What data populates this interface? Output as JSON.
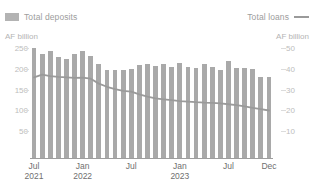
{
  "title": "",
  "legend": {
    "deposits": {
      "label": "Total deposits",
      "marker": "bar-swatch-icon",
      "color": "#b3b3b3"
    },
    "loans": {
      "label": "Total loans",
      "marker": "line-swatch-icon",
      "color": "#9a9a9a"
    }
  },
  "axes": {
    "left_unit": "AF billion",
    "right_unit": "AF billion",
    "left_ticks": [
      "250",
      "200",
      "150",
      "100",
      "50"
    ],
    "right_ticks": [
      "50",
      "40",
      "30",
      "20",
      "10"
    ],
    "x_ticks": [
      {
        "month": "Jul",
        "year": "2021"
      },
      {
        "month": "Jan",
        "year": "2022"
      },
      {
        "month": "Jul",
        "year": ""
      },
      {
        "month": "Jan",
        "year": "2023"
      },
      {
        "month": "Jul",
        "year": ""
      },
      {
        "month": "Dec",
        "year": ""
      }
    ]
  },
  "colors": {
    "bar": "#a9a9a9",
    "line": "#9a9a9a",
    "axis_text": "#bdbdbd",
    "x_text": "#6f6f6f",
    "baseline": "#9e9e9e"
  },
  "chart_data": {
    "type": "bar",
    "title": "",
    "xlabel": "",
    "ylabel": "AF billion",
    "y2label": "AF billion",
    "ylim": [
      0,
      250
    ],
    "y2lim": [
      0,
      50
    ],
    "grid": false,
    "legend_position": "top",
    "categories": [
      "Jul 2021",
      "Aug 2021",
      "Sep 2021",
      "Oct 2021",
      "Nov 2021",
      "Dec 2021",
      "Jan 2022",
      "Feb 2022",
      "Mar 2022",
      "Apr 2022",
      "May 2022",
      "Jun 2022",
      "Jul 2022",
      "Aug 2022",
      "Sep 2022",
      "Oct 2022",
      "Nov 2022",
      "Dec 2022",
      "Jan 2023",
      "Feb 2023",
      "Mar 2023",
      "Apr 2023",
      "May 2023",
      "Jun 2023",
      "Jul 2023",
      "Aug 2023",
      "Sep 2023",
      "Oct 2023",
      "Nov 2023",
      "Dec 2023"
    ],
    "series": [
      {
        "name": "Total deposits",
        "type": "bar",
        "axis": "left",
        "unit": "AF billion",
        "color": "#a9a9a9",
        "values": [
          245,
          232,
          238,
          226,
          220,
          232,
          238,
          228,
          210,
          196,
          196,
          196,
          198,
          208,
          210,
          206,
          210,
          203,
          212,
          204,
          200,
          210,
          204,
          196,
          216,
          200,
          202,
          198,
          180,
          180
        ]
      },
      {
        "name": "Total loans",
        "type": "line",
        "axis": "right",
        "unit": "AF billion",
        "color": "#9a9a9a",
        "values": [
          36.0,
          37.2,
          36.6,
          36.2,
          36.0,
          35.8,
          35.9,
          35.4,
          33.2,
          31.8,
          30.8,
          30.0,
          29.6,
          28.4,
          27.4,
          26.6,
          26.2,
          25.8,
          25.4,
          25.2,
          24.9,
          24.7,
          24.6,
          24.4,
          24.0,
          23.6,
          23.0,
          22.4,
          21.8,
          21.2
        ]
      }
    ]
  }
}
